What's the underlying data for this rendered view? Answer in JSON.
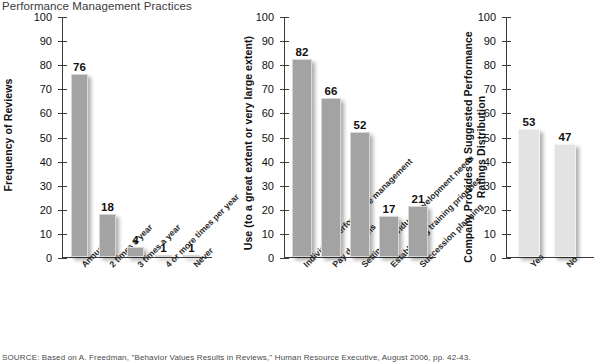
{
  "page_title": "Performance Management Practices",
  "source_note": "SOURCE: Based on A. Freedman, \"Behavior Values Results in Reviews,\" Human Resource Executive, August 2006, pp. 42-43.",
  "colors": {
    "bar_dark": "#a3a3a3",
    "bar_light": "#e3e3e3",
    "axis": "#3b3b3b",
    "text": "#111111"
  },
  "chart_data": [
    {
      "type": "bar",
      "title": "",
      "xlabel": "",
      "ylabel": "Frequency of Reviews",
      "ylim": [
        0,
        100
      ],
      "yticks": [
        0,
        10,
        20,
        30,
        40,
        50,
        60,
        70,
        80,
        90,
        100
      ],
      "grid": false,
      "legend": "none",
      "bar_style": "dark",
      "categories": [
        "Annual",
        "2 times a year",
        "3 times a year",
        "4 or more times per year",
        "Never"
      ],
      "values": [
        76,
        18,
        4,
        1,
        1
      ]
    },
    {
      "type": "bar",
      "title": "",
      "xlabel": "",
      "ylabel": "Use (to a great extent or very large extent)",
      "ylim": [
        0,
        100
      ],
      "yticks": [
        0,
        10,
        20,
        30,
        40,
        50,
        60,
        70,
        80,
        90,
        100
      ],
      "grid": false,
      "legend": "none",
      "bar_style": "dark",
      "categories": [
        "Individual performance management",
        "Pay decisions",
        "Setting individual development needs",
        "Establishing training priorities",
        "Succession planning"
      ],
      "values": [
        82,
        66,
        52,
        17,
        21
      ]
    },
    {
      "type": "bar",
      "title": "",
      "xlabel": "",
      "ylabel": "Company Provides a Suggested Performance Ratings Distribution",
      "ylim": [
        0,
        100
      ],
      "yticks": [
        0,
        10,
        20,
        30,
        40,
        50,
        60,
        70,
        80,
        90,
        100
      ],
      "grid": false,
      "legend": "none",
      "bar_style": "light",
      "categories": [
        "Yes",
        "No"
      ],
      "values": [
        53,
        47
      ]
    }
  ]
}
